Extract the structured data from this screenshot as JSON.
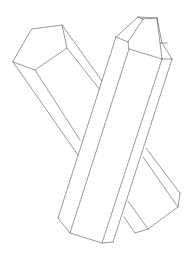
{
  "image": {
    "subject": "line drawing of two crossed crystal prisms",
    "background": "#ffffff",
    "stroke_color": "#555555",
    "width": 191,
    "height": 255
  }
}
